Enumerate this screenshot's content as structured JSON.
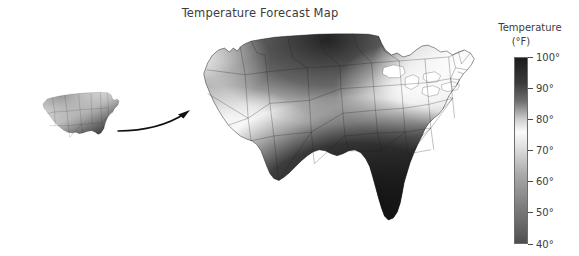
{
  "figure": {
    "title": "Temperature Forecast Map",
    "background_color": "#ffffff"
  },
  "legend": {
    "title": "Temperature",
    "units": "(°F)",
    "orientation": "vertical",
    "position": "right",
    "min_label": "40°",
    "max_label": "100°",
    "ticks": [
      {
        "label": "100°",
        "value": 100,
        "pos_pct": 0
      },
      {
        "label": "90°",
        "value": 90,
        "pos_pct": 16.6667
      },
      {
        "label": "80°",
        "value": 80,
        "pos_pct": 33.3333
      },
      {
        "label": "70°",
        "value": 70,
        "pos_pct": 50
      },
      {
        "label": "60°",
        "value": 60,
        "pos_pct": 66.6667
      },
      {
        "label": "50°",
        "value": 50,
        "pos_pct": 83.3333
      },
      {
        "label": "40°",
        "value": 40,
        "pos_pct": 100
      }
    ],
    "colormap_stops": [
      {
        "value": 100,
        "color": "#1c1c1c"
      },
      {
        "value": 92,
        "color": "#3a3a3a"
      },
      {
        "value": 86,
        "color": "#6e6e6e"
      },
      {
        "value": 80,
        "color": "#cfcfcf"
      },
      {
        "value": 76,
        "color": "#fbfbfb"
      },
      {
        "value": 70,
        "color": "#d9d9d9"
      },
      {
        "value": 62,
        "color": "#a8a8a8"
      },
      {
        "value": 52,
        "color": "#7e7e7e"
      },
      {
        "value": 44,
        "color": "#606060"
      },
      {
        "value": 40,
        "color": "#4e4e4e"
      }
    ]
  },
  "chart_data": {
    "type": "heatmap",
    "subtype": "choropleth-map",
    "title": "Temperature Forecast Map",
    "xlabel": "",
    "ylabel": "",
    "legend_label": "Temperature (°F)",
    "value_range": [
      40,
      100
    ],
    "colorscale": "grayscale-inverted",
    "grid": false,
    "region": "United States",
    "regions": [
      {
        "name": "Pacific Northwest",
        "temperature_f": 72,
        "shade": "#c9c9c9"
      },
      {
        "name": "Northern Rockies",
        "temperature_f": 88,
        "shade": "#5d5d5d"
      },
      {
        "name": "Northern Plains",
        "temperature_f": 93,
        "shade": "#383838"
      },
      {
        "name": "Upper Midwest",
        "temperature_f": 95,
        "shade": "#2e2e2e"
      },
      {
        "name": "California",
        "temperature_f": 76,
        "shade": "#f2f2f2"
      },
      {
        "name": "Southwest Desert",
        "temperature_f": 77,
        "shade": "#efefef"
      },
      {
        "name": "Central Plains",
        "temperature_f": 80,
        "shade": "#d2d2d2"
      },
      {
        "name": "Great Lakes",
        "temperature_f": 74,
        "shade": "#e4e4e4"
      },
      {
        "name": "Northeast",
        "temperature_f": 71,
        "shade": "#f0f0f0"
      },
      {
        "name": "Mid-Atlantic",
        "temperature_f": 84,
        "shade": "#9a9a9a"
      },
      {
        "name": "Southeast",
        "temperature_f": 99,
        "shade": "#202020"
      },
      {
        "name": "Gulf Coast",
        "temperature_f": 100,
        "shade": "#161616"
      },
      {
        "name": "Texas",
        "temperature_f": 98,
        "shade": "#242424"
      },
      {
        "name": "Florida",
        "temperature_f": 100,
        "shade": "#161616"
      }
    ]
  },
  "inset_map": {
    "label": "",
    "description": "small overview United States temperature map"
  },
  "arrow": {
    "label": "",
    "description": "curved arrow from inset map to main map"
  }
}
